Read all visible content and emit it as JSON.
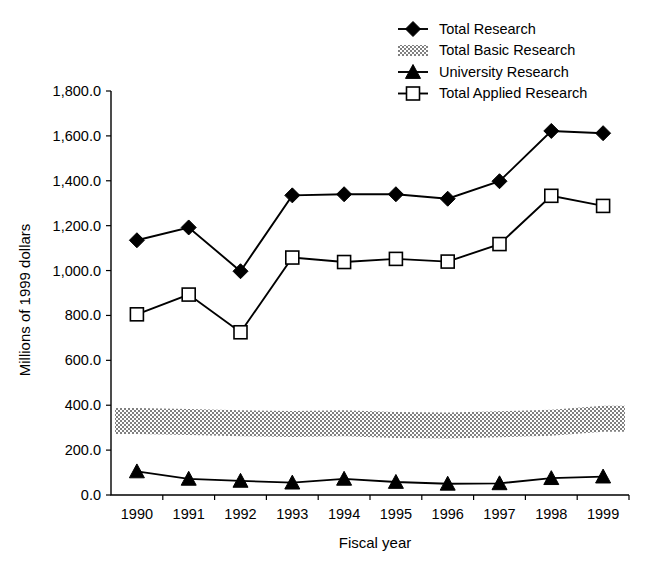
{
  "chart_data": {
    "type": "line",
    "title": "",
    "xlabel": "Fiscal year",
    "ylabel": "Millions of 1999 dollars",
    "categories": [
      "1990",
      "1991",
      "1992",
      "1993",
      "1994",
      "1995",
      "1996",
      "1997",
      "1998",
      "1999"
    ],
    "x": [
      1990,
      1991,
      1992,
      1993,
      1994,
      1995,
      1996,
      1997,
      1998,
      1999
    ],
    "ylim": [
      0,
      1800
    ],
    "yticks": [
      0,
      200,
      400,
      600,
      800,
      1000,
      1200,
      1400,
      1600,
      1800
    ],
    "ytick_labels": [
      "0.0",
      "200.0",
      "400.0",
      "600.0",
      "800.0",
      "1,000.0",
      "1,200.0",
      "1,400.0",
      "1,600.0",
      "1,800.0"
    ],
    "grid": false,
    "legend_position": "top-right",
    "series": [
      {
        "name": "Total Research",
        "marker": "filled-diamond",
        "style": "line",
        "values": [
          1135,
          1192,
          997,
          1335,
          1340,
          1340,
          1320,
          1398,
          1622,
          1612
        ]
      },
      {
        "name": "Total Basic Research",
        "marker": "gray-band",
        "style": "band",
        "values": [
          330,
          325,
          320,
          316,
          320,
          312,
          310,
          315,
          322,
          340
        ],
        "band_thickness": 26
      },
      {
        "name": "University Research",
        "marker": "filled-triangle",
        "style": "line",
        "values": [
          105,
          72,
          63,
          55,
          72,
          58,
          50,
          52,
          75,
          82
        ]
      },
      {
        "name": "Total Applied Research",
        "marker": "open-square",
        "style": "line",
        "values": [
          805,
          893,
          725,
          1058,
          1038,
          1052,
          1040,
          1118,
          1333,
          1288
        ]
      }
    ]
  },
  "legend": {
    "entries": [
      {
        "label": "Total Research",
        "marker": "filled-diamond"
      },
      {
        "label": "Total Basic Research",
        "marker": "gray-band"
      },
      {
        "label": "University Research",
        "marker": "filled-triangle"
      },
      {
        "label": "Total Applied Research",
        "marker": "open-square"
      }
    ]
  },
  "caption": {
    "text": ""
  }
}
